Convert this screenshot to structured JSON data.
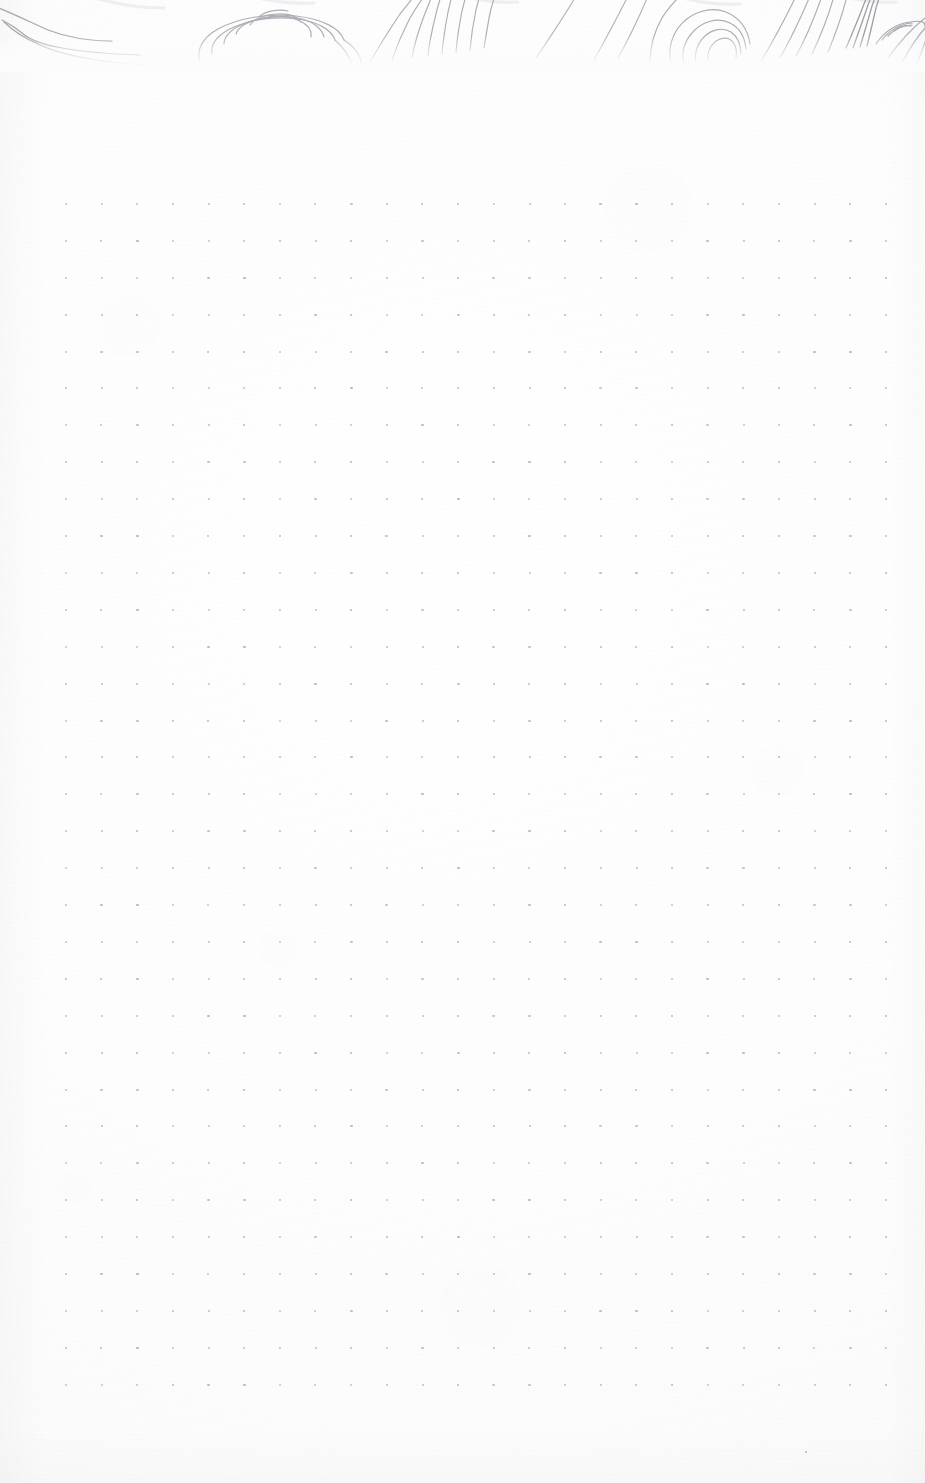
{
  "page": {
    "kind": "dot-grid-notebook-page",
    "width": 925,
    "height": 1483,
    "paper_color": "#fcfcfc",
    "caption": ""
  },
  "header_art": {
    "name": "topographic-contour-band",
    "description": "Hand-drawn topographic contour lines cropped by the top edge of the page",
    "ink_color": "#9a9aa2",
    "band_height": 72,
    "visible_fade_y": 50
  },
  "dot_grid": {
    "name": "bullet-journal-dot-grid",
    "dot_color": "#b6b6bb",
    "dot_size": 2.2,
    "columns": 24,
    "rows": 33,
    "origin_x": 66,
    "origin_y": 204,
    "spacing_x": 35.65,
    "spacing_y": 36.9,
    "margin_left": 66,
    "margin_right": 39,
    "margin_top": 204,
    "margin_bottom": 98
  },
  "stray_marks": [
    {
      "name": "isolated-dot",
      "x": 806,
      "y": 1452,
      "color": "#b0b0b6",
      "size": 2.4
    }
  ],
  "content": {
    "text_entries": [],
    "note": ""
  }
}
